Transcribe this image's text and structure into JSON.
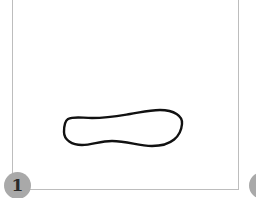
{
  "figure": {
    "panels": [
      {
        "step_label": "1"
      },
      {
        "step_label": ""
      }
    ],
    "colors": {
      "frame_border": "#bdbdbd",
      "badge_fill": "#a9a9a9",
      "badge_text": "#2b2b2b",
      "outline_stroke": "#111111"
    },
    "icons": {
      "outline_shape": "closed-freehand-outline"
    }
  }
}
